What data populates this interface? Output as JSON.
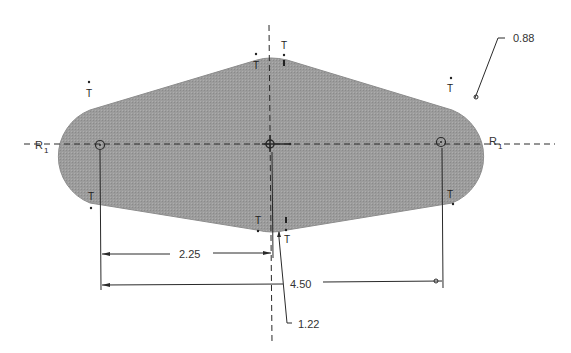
{
  "colors": {
    "background": "#ffffff",
    "profile_fill": "#9a9a9a",
    "profile_edge": "#8c8c8c",
    "line": "#2a2a2a",
    "text": "#333333"
  },
  "sketch": {
    "profile": {
      "shape": "slot-with-tapered-sides",
      "left_arc_center": [
        100,
        144
      ],
      "right_arc_center": [
        441,
        144
      ],
      "center_point": [
        270,
        144
      ]
    },
    "centerlines": {
      "horizontal_y": 144,
      "vertical_x": 270
    },
    "constraint_labels": {
      "tangent": "T",
      "radius_left": "R",
      "radius_left_sub": "1",
      "radius_right": "R",
      "radius_right_sub": "1"
    },
    "dimensions": {
      "width_half": "2.25",
      "width_full": "4.50",
      "radius": "0.88",
      "height_half": "1.22"
    }
  }
}
